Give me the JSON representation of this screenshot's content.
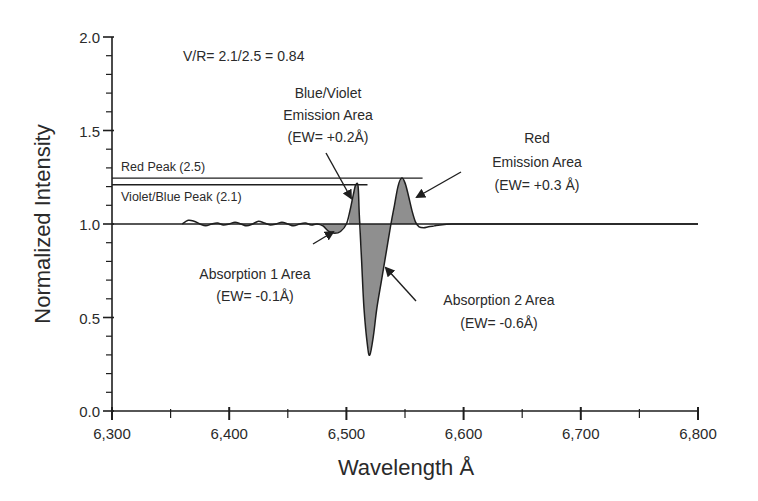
{
  "chart_data": {
    "type": "line",
    "title": "",
    "xlabel": "Wavelength Å",
    "ylabel": "Normalized Intensity",
    "xlim": [
      6300,
      6800
    ],
    "ylim": [
      0.0,
      2.0
    ],
    "x_ticks": [
      6300,
      6400,
      6500,
      6600,
      6700,
      6800
    ],
    "x_tick_labels": [
      "6,300",
      "6,400",
      "6,500",
      "6,600",
      "6,700",
      "6,800"
    ],
    "x_minor_step": 50,
    "y_ticks": [
      0.0,
      0.5,
      1.0,
      1.5,
      2.0
    ],
    "y_tick_labels": [
      "0.0",
      "0.5",
      "1.0",
      "1.5",
      "2.0"
    ],
    "y_minor_step": 0.1,
    "grid": false,
    "continuum": 1.0,
    "series": [
      {
        "name": "Normalized spectrum",
        "x": [
          6360,
          6365,
          6370,
          6375,
          6380,
          6385,
          6390,
          6395,
          6400,
          6405,
          6410,
          6415,
          6420,
          6425,
          6430,
          6435,
          6440,
          6445,
          6450,
          6455,
          6460,
          6465,
          6470,
          6475,
          6480,
          6485,
          6490,
          6495,
          6500,
          6503,
          6506,
          6508,
          6510,
          6511,
          6513,
          6515,
          6518,
          6520,
          6523,
          6526,
          6530,
          6534,
          6538,
          6541,
          6544,
          6547,
          6550,
          6553,
          6556,
          6559,
          6562,
          6566,
          6570,
          6575,
          6580,
          6590,
          6600,
          6610,
          6620,
          6640,
          6680,
          6720,
          6760,
          6800
        ],
        "y": [
          1.0,
          1.02,
          1.015,
          1.0,
          0.99,
          1.0,
          1.005,
          0.995,
          1.0,
          1.01,
          1.0,
          0.99,
          1.0,
          1.015,
          1.005,
          0.995,
          1.0,
          1.01,
          1.0,
          0.99,
          1.0,
          1.005,
          0.995,
          1.0,
          0.99,
          0.96,
          0.95,
          0.96,
          1.0,
          1.07,
          1.16,
          1.21,
          1.2,
          1.05,
          0.8,
          0.55,
          0.35,
          0.3,
          0.4,
          0.55,
          0.7,
          0.85,
          1.0,
          1.1,
          1.2,
          1.245,
          1.22,
          1.15,
          1.07,
          1.01,
          0.985,
          0.98,
          0.985,
          0.99,
          0.995,
          1.0,
          1.0,
          1.0,
          1.0,
          1.0,
          1.0,
          1.0,
          1.0,
          1.0
        ]
      }
    ],
    "reference_lines": [
      {
        "name": "Red Peak",
        "label": "Red Peak (2.5)",
        "y": 1.245,
        "x_range": [
          6300,
          6565
        ]
      },
      {
        "name": "Violet/Blue Peak",
        "label": "Violet/Blue Peak (2.1)",
        "y": 1.21,
        "x_range": [
          6300,
          6518
        ]
      }
    ],
    "shaded_regions": [
      {
        "name": "Absorption 1",
        "x_range": [
          6480,
          6502
        ],
        "ew": "-0.1Å"
      },
      {
        "name": "Blue/Violet Emission",
        "x_range": [
          6502,
          6512
        ],
        "ew": "+0.2Å"
      },
      {
        "name": "Absorption 2",
        "x_range": [
          6512,
          6538
        ],
        "ew": "-0.6Å"
      },
      {
        "name": "Red Emission",
        "x_range": [
          6538,
          6560
        ],
        "ew": "+0.3 Å"
      }
    ],
    "annotations": {
      "vr_ratio": "V/R= 2.1/2.5 = 0.84",
      "blue_violet": [
        "Blue/Violet",
        "Emission Area",
        "(EW= +0.2Å)"
      ],
      "red": [
        "Red",
        "Emission Area",
        "(EW= +0.3 Å)"
      ],
      "absorption1": [
        "Absorption 1 Area",
        "(EW= -0.1Å)"
      ],
      "absorption2": [
        "Absorption 2 Area",
        "(EW= -0.6Å)"
      ]
    },
    "colors": {
      "line": "#1e1e1e",
      "fill": "#8f8f8f",
      "text": "#2a2a2a"
    }
  }
}
